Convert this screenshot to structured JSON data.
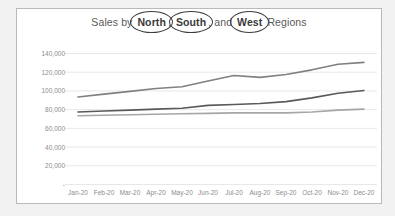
{
  "chart_data": {
    "type": "line",
    "title": "Sales by North, South, and West Regions",
    "title_parts": [
      {
        "text": "Sales by ",
        "circled": false
      },
      {
        "text": "North",
        "circled": true
      },
      {
        "text": ", ",
        "circled": false
      },
      {
        "text": "South",
        "circled": true
      },
      {
        "text": ", and ",
        "circled": false
      },
      {
        "text": "West",
        "circled": true
      },
      {
        "text": " Regions",
        "circled": false
      }
    ],
    "xlabel": "",
    "ylabel": "",
    "categories": [
      "Jan-20",
      "Feb-20",
      "Mar-20",
      "Apr-20",
      "May-20",
      "Jun-20",
      "Jul-20",
      "Aug-20",
      "Sep-20",
      "Oct-20",
      "Nov-20",
      "Dec-20"
    ],
    "ylim": [
      0,
      140000
    ],
    "yticks": [
      0,
      20000,
      40000,
      60000,
      80000,
      100000,
      120000,
      140000
    ],
    "ytick_labels": [
      "-",
      "20,000",
      "40,000",
      "60,000",
      "80,000",
      "100,000",
      "120,000",
      "140,000"
    ],
    "grid": true,
    "grid_axis": "y",
    "legend": "none",
    "series": [
      {
        "name": "North",
        "color": "#808080",
        "values": [
          93000,
          96000,
          99000,
          102000,
          104000,
          110000,
          116000,
          114000,
          117000,
          122000,
          128000,
          130000
        ]
      },
      {
        "name": "South",
        "color": "#595959",
        "values": [
          77000,
          78000,
          79000,
          80000,
          81000,
          84000,
          85000,
          86000,
          88000,
          92000,
          97000,
          100000
        ]
      },
      {
        "name": "West",
        "color": "#a6a6a6",
        "values": [
          73000,
          73500,
          74000,
          74500,
          75000,
          75500,
          76000,
          76000,
          76000,
          77000,
          79000,
          80000
        ]
      }
    ],
    "colors": {
      "plot_background": "#ffffff",
      "gridline": "#e8e8e8",
      "axis_text": "#8c8c8c",
      "title_text": "#595959",
      "annotation_circle": "#3c3c3c",
      "chart_border": "#b9b9b9",
      "page_background": "#f2f2f2"
    }
  }
}
